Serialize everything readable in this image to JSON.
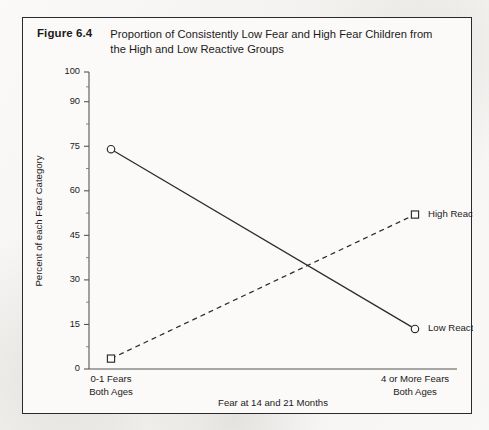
{
  "figure": {
    "number": "Figure 6.4",
    "caption": "Proportion of Consistently Low Fear and High Fear Children from the High and Low Reactive Groups"
  },
  "chart_data": {
    "type": "line",
    "title": "Proportion of Consistently Low Fear and High Fear Children from the High and Low Reactive Groups",
    "xlabel": "Fear at 14 and 21 Months",
    "ylabel": "Percent of each Fear Category",
    "categories": [
      "0-1 Fears Both Ages",
      "4 or More Fears Both Ages"
    ],
    "category_lines": [
      [
        "0-1 Fears",
        "Both Ages"
      ],
      [
        "4 or More Fears",
        "Both Ages"
      ]
    ],
    "ylim": [
      0,
      100
    ],
    "yticks": [
      0,
      15,
      30,
      45,
      60,
      75,
      90,
      100
    ],
    "ytick_labels": [
      "0",
      "15",
      "30",
      "45",
      "60",
      "75",
      "90",
      "100"
    ],
    "minor_ticks": [
      7.5,
      22.5,
      37.5,
      52.5,
      67.5,
      82.5,
      95
    ],
    "grid": false,
    "legend_position": "inline-right",
    "series": [
      {
        "name": "Low Reactive",
        "label": "Low Reactive",
        "style": "solid",
        "marker": "circle",
        "values": [
          74,
          13.5
        ],
        "color": "#2a2a2a"
      },
      {
        "name": "High Reactive",
        "label": "High Reactive",
        "style": "dashed",
        "marker": "square",
        "values": [
          3.5,
          52
        ],
        "color": "#2a2a2a"
      }
    ]
  },
  "colors": {
    "page_background": "#f4f3f1",
    "frame_background": "#fbfaf8",
    "frame_border": "#2b2b2b",
    "ink": "#1b1b1b",
    "axis": "#555555"
  }
}
